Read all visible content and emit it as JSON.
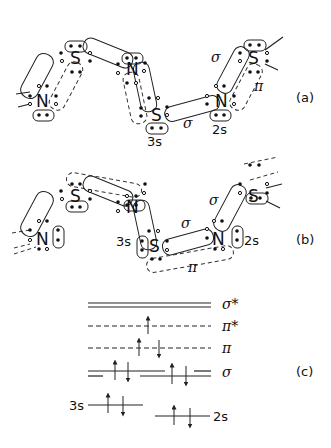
{
  "figure": {
    "panels": [
      {
        "id": "a",
        "label": "(a)",
        "atoms": [
          "N",
          "S",
          "N",
          "S",
          "N",
          "S"
        ],
        "bond_labels": {
          "sigma_upper": "σ",
          "pi": "π",
          "sigma_lower": "σ"
        },
        "orbital_labels": {
          "s3": "3s",
          "s2": "2s"
        }
      },
      {
        "id": "b",
        "label": "(b)",
        "atoms": [
          "N",
          "S",
          "N",
          "S",
          "N",
          "S"
        ],
        "bond_labels": {
          "sigma_upper": "σ",
          "sigma_lower": "σ",
          "pi": "π"
        },
        "orbital_labels": {
          "s3": "3s",
          "s2": "2s"
        }
      },
      {
        "id": "c",
        "label": "(c)",
        "levels": [
          {
            "name": "σ*",
            "style": "double",
            "electrons": []
          },
          {
            "name": "π*",
            "style": "dashed",
            "electrons": [
              "up"
            ]
          },
          {
            "name": "π",
            "style": "dashed",
            "electrons": [
              "up",
              "down"
            ]
          },
          {
            "name": "σ",
            "style": "double-split",
            "electrons": [
              "up",
              "down",
              "up",
              "down"
            ]
          },
          {
            "name": "3s",
            "style": "single",
            "electrons": [
              "up",
              "down"
            ]
          },
          {
            "name": "2s",
            "style": "single",
            "electrons": [
              "up",
              "down"
            ]
          }
        ]
      }
    ]
  }
}
